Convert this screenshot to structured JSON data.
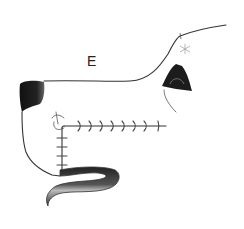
{
  "figure": {
    "panel_label": "E",
    "colors": {
      "ink": "#333333",
      "nose": "#1a1a1a",
      "flap_dark": "#2a2a2a",
      "flap_light": "#bdbdbd",
      "background": "#ffffff"
    }
  }
}
